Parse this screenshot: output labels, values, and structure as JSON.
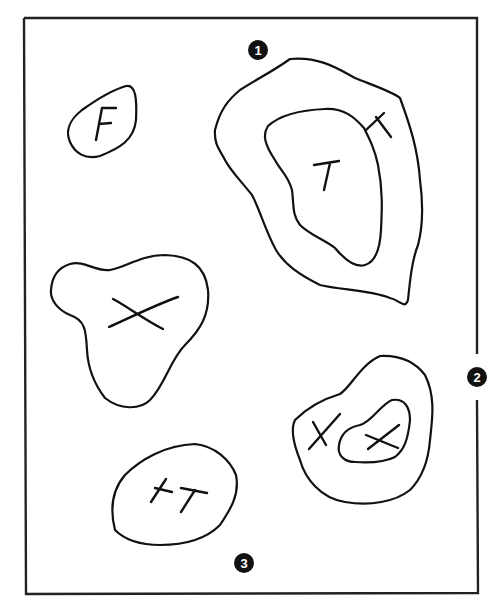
{
  "diagram": {
    "type": "venn-style region diagram (hand-drawn)",
    "colors": {
      "ink": "#111111",
      "background": "#ffffff",
      "badge_text": "#ffffff"
    },
    "frame": {
      "description": "rectangular border, right side broken at marker 2"
    },
    "markers": [
      {
        "id": "marker-1",
        "label": "1",
        "position": "top center"
      },
      {
        "id": "marker-2",
        "label": "2",
        "position": "right edge, middle (on border gap)"
      },
      {
        "id": "marker-3",
        "label": "3",
        "position": "bottom center"
      }
    ],
    "regions": [
      {
        "id": "region-f",
        "shape": "small blob, upper left",
        "label": "F"
      },
      {
        "id": "region-t-outer",
        "shape": "large outer ring, upper right",
        "label": "T (rotated, on ring)"
      },
      {
        "id": "region-t-inner",
        "shape": "inner blob inside upper-right ring",
        "label": "T"
      },
      {
        "id": "region-x",
        "shape": "triangular blob, middle left",
        "label": "X"
      },
      {
        "id": "region-x-outer",
        "shape": "outer ring, lower right",
        "label": "X"
      },
      {
        "id": "region-x-inner",
        "shape": "inner blob inside lower-right ring",
        "label": "X"
      },
      {
        "id": "region-plus-t",
        "shape": "blob, bottom left-center",
        "label": "+T"
      }
    ]
  }
}
